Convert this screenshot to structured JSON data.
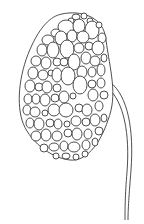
{
  "illustration": {
    "subject": "cellular bud cluster with stem",
    "stroke": "#3a3a3a",
    "fill": "#ffffff",
    "outline": "M62,14 C80,10 104,16 106,40 C110,70 118,95 108,120 C100,145 85,162 70,160 C50,158 28,140 22,120 C16,100 20,70 32,45 C40,28 50,16 62,14 Z",
    "stem": [
      "M110,82 C128,96 134,130 131,170 C129,195 128,210 128,220",
      "M108,88 C124,102 130,134 127,172 C125,196 125,210 125,220"
    ],
    "cells": [
      [
        76,
        17,
        4,
        3
      ],
      [
        84,
        16,
        3,
        3
      ],
      [
        71,
        21,
        3,
        3
      ],
      [
        90,
        21,
        3,
        3
      ],
      [
        66,
        27,
        8,
        7
      ],
      [
        79,
        26,
        6,
        7
      ],
      [
        92,
        30,
        7,
        9
      ],
      [
        99,
        25,
        3,
        3
      ],
      [
        56,
        33,
        5,
        4
      ],
      [
        48,
        40,
        6,
        5
      ],
      [
        61,
        38,
        6,
        7
      ],
      [
        72,
        36,
        5,
        6
      ],
      [
        83,
        37,
        6,
        6
      ],
      [
        102,
        38,
        4,
        5
      ],
      [
        42,
        50,
        5,
        6
      ],
      [
        53,
        50,
        6,
        8
      ],
      [
        67,
        49,
        7,
        9
      ],
      [
        79,
        48,
        5,
        5
      ],
      [
        89,
        46,
        4,
        4
      ],
      [
        98,
        48,
        6,
        7
      ],
      [
        36,
        61,
        5,
        5
      ],
      [
        46,
        63,
        5,
        6
      ],
      [
        57,
        62,
        4,
        4
      ],
      [
        64,
        62,
        4,
        4
      ],
      [
        74,
        62,
        6,
        8
      ],
      [
        86,
        58,
        5,
        6
      ],
      [
        95,
        61,
        5,
        5
      ],
      [
        104,
        58,
        3,
        4
      ],
      [
        33,
        73,
        5,
        6
      ],
      [
        43,
        75,
        5,
        5
      ],
      [
        51,
        73,
        3,
        3
      ],
      [
        57,
        75,
        5,
        7
      ],
      [
        68,
        76,
        7,
        9
      ],
      [
        82,
        72,
        5,
        6
      ],
      [
        92,
        72,
        4,
        5
      ],
      [
        101,
        70,
        4,
        6
      ],
      [
        30,
        86,
        5,
        6
      ],
      [
        39,
        87,
        4,
        4
      ],
      [
        47,
        87,
        5,
        6
      ],
      [
        57,
        88,
        4,
        4
      ],
      [
        80,
        85,
        7,
        9
      ],
      [
        92,
        84,
        4,
        4
      ],
      [
        101,
        83,
        4,
        5
      ],
      [
        28,
        99,
        4,
        5
      ],
      [
        36,
        99,
        4,
        5
      ],
      [
        45,
        100,
        5,
        6
      ],
      [
        55,
        98,
        4,
        4
      ],
      [
        64,
        97,
        5,
        6
      ],
      [
        73,
        96,
        3,
        3
      ],
      [
        93,
        95,
        5,
        6
      ],
      [
        104,
        95,
        4,
        4
      ],
      [
        27,
        110,
        4,
        5
      ],
      [
        35,
        112,
        5,
        5
      ],
      [
        45,
        113,
        3,
        3
      ],
      [
        54,
        110,
        6,
        6
      ],
      [
        66,
        110,
        7,
        7
      ],
      [
        79,
        108,
        4,
        4
      ],
      [
        87,
        110,
        5,
        6
      ],
      [
        99,
        106,
        4,
        5
      ],
      [
        30,
        123,
        4,
        5
      ],
      [
        39,
        124,
        5,
        6
      ],
      [
        50,
        123,
        4,
        4
      ],
      [
        58,
        124,
        4,
        5
      ],
      [
        67,
        124,
        3,
        3
      ],
      [
        76,
        121,
        5,
        5
      ],
      [
        86,
        122,
        4,
        4
      ],
      [
        95,
        120,
        5,
        6
      ],
      [
        104,
        118,
        3,
        4
      ],
      [
        36,
        136,
        5,
        5
      ],
      [
        46,
        135,
        5,
        6
      ],
      [
        57,
        136,
        5,
        5
      ],
      [
        68,
        133,
        4,
        4
      ],
      [
        77,
        134,
        5,
        6
      ],
      [
        88,
        134,
        4,
        5
      ],
      [
        99,
        131,
        4,
        4
      ],
      [
        44,
        148,
        4,
        4
      ],
      [
        54,
        147,
        5,
        4
      ],
      [
        64,
        146,
        4,
        5
      ],
      [
        74,
        147,
        6,
        5
      ],
      [
        86,
        145,
        4,
        5
      ],
      [
        95,
        142,
        3,
        4
      ],
      [
        56,
        156,
        3,
        3
      ],
      [
        66,
        156,
        4,
        3
      ],
      [
        76,
        157,
        3,
        3
      ],
      [
        85,
        154,
        3,
        3
      ]
    ]
  }
}
